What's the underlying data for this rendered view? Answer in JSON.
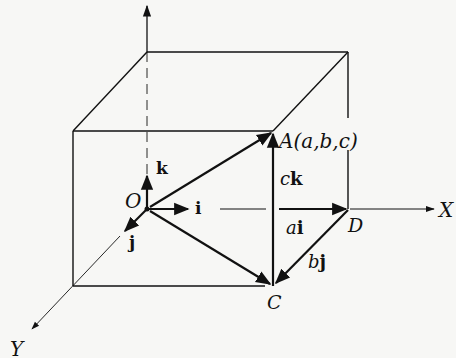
{
  "diagram": {
    "colors": {
      "line": "#111111",
      "background": "#f7f7f5"
    },
    "labels": {
      "origin": "O",
      "point_A": "A(a,b,c)",
      "point_C": "C",
      "point_D": "D",
      "axis_x": "X",
      "axis_y": "Y",
      "unit_i": "i",
      "unit_j": "j",
      "unit_k": "k",
      "ck_coef": "c",
      "ck_vec": "k",
      "ai_coef": "a",
      "ai_vec": "i",
      "bj_coef": "b",
      "bj_vec": "j"
    },
    "vectors": [
      {
        "name": "OA",
        "from": "O",
        "to": "A"
      },
      {
        "name": "OD",
        "label": "ai",
        "from": "O",
        "to": "D"
      },
      {
        "name": "DC",
        "label": "bj",
        "from": "D",
        "to": "C"
      },
      {
        "name": "OC",
        "from": "O",
        "to": "C"
      },
      {
        "name": "CA",
        "label": "ck",
        "from": "C",
        "to": "A"
      }
    ]
  }
}
